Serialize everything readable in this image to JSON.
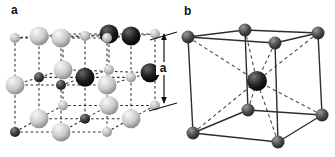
{
  "figure": {
    "name": "crystal-structure-figure",
    "background": "#ffffff",
    "panel_a": {
      "label": "a",
      "structure": "rock-salt-unit-cell",
      "lattice": {
        "n": 3,
        "proj": {
          "x0": 15,
          "dxi": 46,
          "dxk": 24,
          "y0": 38,
          "dyj": 47,
          "persp": 0.12,
          "dyk": -2
        },
        "big_radius": 9.5,
        "small_radius": 5,
        "black_big_sites": [
          [
            1,
            0,
            2
          ],
          [
            2,
            0,
            1
          ],
          [
            1,
            1,
            1
          ],
          [
            2,
            1,
            2
          ]
        ],
        "dark_small_sites": [
          [
            0,
            1,
            1
          ],
          [
            1,
            1,
            0
          ],
          [
            0,
            2,
            0
          ],
          [
            1,
            2,
            1
          ]
        ],
        "offsets": {
          "2,1,2": [
            -5,
            3
          ]
        }
      },
      "dimension": {
        "label": "a",
        "line_x": 164,
        "y_top": 33,
        "y_bottom": 104,
        "ext_top": [
          150,
          40,
          177,
          32
        ],
        "ext_bottom": [
          149,
          111,
          177,
          103
        ],
        "label_x": 163,
        "label_y": 72
      },
      "colors": {
        "grid": "#2a2a2a",
        "big_light": [
          "#f8f8f8",
          "#cccccc",
          "#7e7e7e"
        ],
        "small_light": [
          "#f2f2f2",
          "#bdbdbd",
          "#8a8a8a"
        ],
        "small_dark": [
          "#888888",
          "#3a3a3a",
          "#111111"
        ],
        "big_black": [
          "#666666",
          "#1c1c1c",
          "#000000"
        ],
        "annotation": "#111111"
      }
    },
    "panel_b": {
      "label": "b",
      "structure": "body-centered-cubic-cell",
      "corners": {
        "ftl": [
          188,
          37
        ],
        "ftr": [
          275,
          43
        ],
        "fbl": [
          193,
          133
        ],
        "fbr": [
          278,
          142
        ],
        "btl": [
          245,
          30
        ],
        "btr": [
          318,
          33
        ],
        "bbl": [
          248,
          110
        ],
        "bbr": [
          322,
          115
        ]
      },
      "edges": [
        [
          "ftl",
          "btl"
        ],
        [
          "btl",
          "btr"
        ],
        [
          "btr",
          "ftr"
        ],
        [
          "ftr",
          "ftl"
        ],
        [
          "fbl",
          "bbl"
        ],
        [
          "bbl",
          "bbr"
        ],
        [
          "bbr",
          "fbr"
        ],
        [
          "fbr",
          "fbl"
        ],
        [
          "ftl",
          "fbl"
        ],
        [
          "btl",
          "bbl"
        ],
        [
          "btr",
          "bbr"
        ],
        [
          "ftr",
          "fbr"
        ]
      ],
      "center": {
        "x": 257,
        "y": 81,
        "r": 10
      },
      "corner_radius": 6.5,
      "colors": {
        "edge": "#2e2e2e",
        "diagonal": "#4a4a4a",
        "corner_sphere": [
          "#9a9a9a",
          "#4a4a4a",
          "#1f1f1f"
        ],
        "center_sphere": [
          "#777777",
          "#222222",
          "#000000"
        ]
      }
    }
  }
}
